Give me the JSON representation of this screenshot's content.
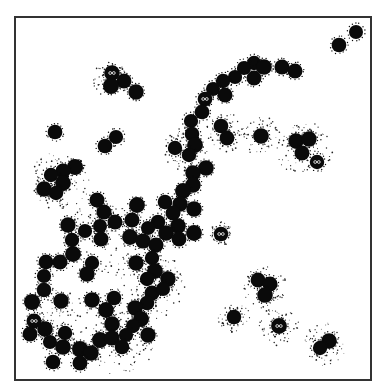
{
  "figure": {
    "background": "#ffffff",
    "blob_color": "#0a0a0a",
    "speckle_color": "#222222",
    "frame_color": "#333333",
    "frame": {
      "x": 14,
      "y": 16,
      "width": 356,
      "height": 363
    },
    "blob_radius": 7.5,
    "blobs": [
      [
        356,
        32
      ],
      [
        339,
        45
      ],
      [
        112,
        73,
        1
      ],
      [
        124,
        81
      ],
      [
        111,
        86
      ],
      [
        136,
        92
      ],
      [
        55,
        132
      ],
      [
        116,
        137
      ],
      [
        105,
        146
      ],
      [
        254,
        63
      ],
      [
        244,
        68
      ],
      [
        264,
        67
      ],
      [
        282,
        67
      ],
      [
        295,
        71
      ],
      [
        235,
        77
      ],
      [
        254,
        78
      ],
      [
        223,
        81
      ],
      [
        213,
        89
      ],
      [
        225,
        95
      ],
      [
        205,
        99,
        1
      ],
      [
        202,
        112
      ],
      [
        191,
        121
      ],
      [
        192,
        134
      ],
      [
        195,
        145
      ],
      [
        175,
        148
      ],
      [
        189,
        155
      ],
      [
        206,
        168
      ],
      [
        193,
        173
      ],
      [
        193,
        185
      ],
      [
        183,
        191
      ],
      [
        221,
        126
      ],
      [
        227,
        138
      ],
      [
        261,
        136
      ],
      [
        296,
        141
      ],
      [
        309,
        139
      ],
      [
        302,
        153
      ],
      [
        317,
        162,
        1
      ],
      [
        75,
        167
      ],
      [
        63,
        171
      ],
      [
        51,
        175
      ],
      [
        63,
        183
      ],
      [
        44,
        189
      ],
      [
        56,
        193
      ],
      [
        97,
        200
      ],
      [
        137,
        205
      ],
      [
        165,
        202
      ],
      [
        180,
        204
      ],
      [
        194,
        209
      ],
      [
        104,
        212
      ],
      [
        173,
        213
      ],
      [
        115,
        222
      ],
      [
        132,
        220
      ],
      [
        158,
        222
      ],
      [
        68,
        225
      ],
      [
        85,
        231
      ],
      [
        100,
        226
      ],
      [
        148,
        228
      ],
      [
        178,
        226
      ],
      [
        166,
        233
      ],
      [
        194,
        233
      ],
      [
        221,
        234,
        1
      ],
      [
        72,
        240
      ],
      [
        101,
        239
      ],
      [
        130,
        237
      ],
      [
        143,
        241
      ],
      [
        156,
        245
      ],
      [
        179,
        239
      ],
      [
        73,
        254
      ],
      [
        46,
        262
      ],
      [
        60,
        262
      ],
      [
        92,
        263
      ],
      [
        136,
        263
      ],
      [
        152,
        258
      ],
      [
        87,
        274
      ],
      [
        155,
        271
      ],
      [
        147,
        279
      ],
      [
        168,
        279
      ],
      [
        44,
        276
      ],
      [
        44,
        290
      ],
      [
        152,
        293
      ],
      [
        163,
        289
      ],
      [
        32,
        302
      ],
      [
        61,
        301
      ],
      [
        92,
        300
      ],
      [
        114,
        298
      ],
      [
        147,
        303
      ],
      [
        106,
        310
      ],
      [
        135,
        308
      ],
      [
        34,
        321,
        1
      ],
      [
        141,
        319
      ],
      [
        112,
        324
      ],
      [
        30,
        334
      ],
      [
        45,
        329
      ],
      [
        65,
        333
      ],
      [
        133,
        326
      ],
      [
        126,
        335
      ],
      [
        148,
        335
      ],
      [
        100,
        340
      ],
      [
        112,
        338
      ],
      [
        50,
        342
      ],
      [
        63,
        347
      ],
      [
        80,
        349
      ],
      [
        122,
        347
      ],
      [
        91,
        353
      ],
      [
        53,
        362
      ],
      [
        80,
        363
      ],
      [
        258,
        280
      ],
      [
        270,
        284
      ],
      [
        265,
        295
      ],
      [
        234,
        317
      ],
      [
        279,
        326,
        1
      ],
      [
        329,
        341
      ],
      [
        320,
        348
      ]
    ],
    "speckle_clouds": [
      [
        60,
        180,
        30
      ],
      [
        110,
        80,
        18
      ],
      [
        185,
        150,
        22
      ],
      [
        225,
        132,
        20
      ],
      [
        261,
        136,
        20
      ],
      [
        305,
        150,
        28
      ],
      [
        150,
        285,
        35
      ],
      [
        100,
        240,
        40
      ],
      [
        60,
        320,
        30
      ],
      [
        120,
        340,
        35
      ],
      [
        265,
        288,
        22
      ],
      [
        234,
        317,
        16
      ],
      [
        279,
        326,
        20
      ],
      [
        325,
        344,
        22
      ],
      [
        221,
        234,
        12
      ]
    ]
  }
}
